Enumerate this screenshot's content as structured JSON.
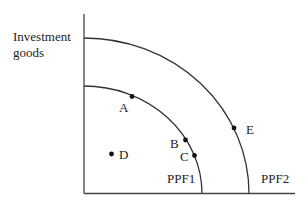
{
  "diagram": {
    "y_axis_label_line1": "Investment",
    "y_axis_label_line2": "goods",
    "curves": [
      {
        "name": "PPF1",
        "label": "PPF1"
      },
      {
        "name": "PPF2",
        "label": "PPF2"
      }
    ],
    "points": [
      {
        "label": "A",
        "on": "PPF1"
      },
      {
        "label": "B",
        "on": "PPF1"
      },
      {
        "label": "C",
        "on": "PPF1"
      },
      {
        "label": "D",
        "on": "inside PPF1"
      },
      {
        "label": "E",
        "on": "PPF2"
      }
    ],
    "colors": {
      "line": "#333333",
      "point": "#111111",
      "text": "#222222"
    }
  }
}
